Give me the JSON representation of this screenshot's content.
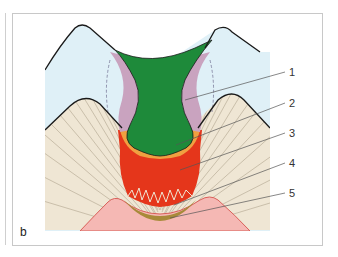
{
  "figure": {
    "panel_letter": "b",
    "labels": [
      {
        "id": 1,
        "text": "1"
      },
      {
        "id": 2,
        "text": "2"
      },
      {
        "id": 3,
        "text": "3"
      },
      {
        "id": 4,
        "text": "4"
      },
      {
        "id": 5,
        "text": "5"
      }
    ],
    "colors": {
      "enamel": "#dff0f7",
      "dentin": "#efe6d4",
      "dentin_tubules": "#b9ae98",
      "cavity_green": "#1e8a3a",
      "translucent_zone_mauve": "#c9a3bf",
      "orange_zone": "#f0a040",
      "red_zone": "#e5361b",
      "sclerotic_band": "#a88a3a",
      "pulp": "#f5b8b4",
      "pulp_edge": "#d9605a",
      "outline": "#1a1a1a"
    }
  }
}
